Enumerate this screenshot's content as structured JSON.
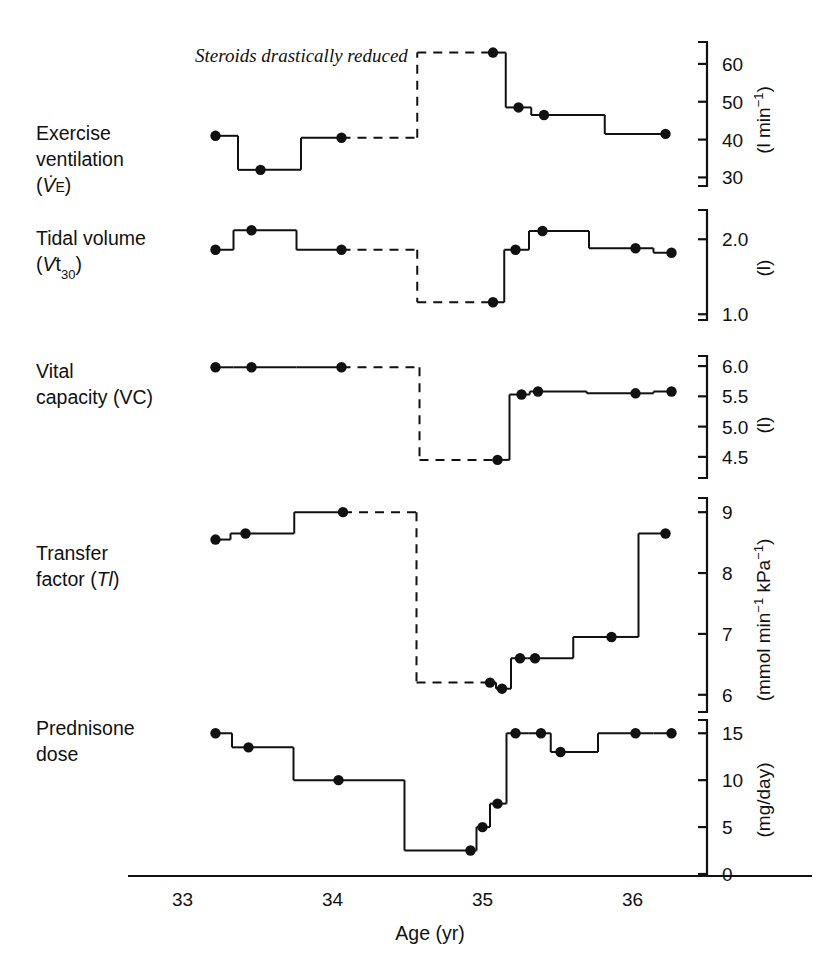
{
  "figure": {
    "background": "#ffffff",
    "ink": "#111111",
    "annotation": "Steroids drastically reduced",
    "xlabel": "Age (yr)",
    "xticks": [
      "33",
      "34",
      "35",
      "36"
    ],
    "xtick_values": [
      33,
      34,
      35,
      36
    ],
    "xlim": [
      32.95,
      36.45
    ]
  },
  "chart_data": {
    "type": "line",
    "title": "",
    "subtitle": "",
    "xlabel": "Age (yr)",
    "ylabel": "",
    "grid": false,
    "legend": "none",
    "annotations": [
      {
        "text": "Steroids drastically reduced",
        "x": 34.93,
        "y_panel": "exercise_ventilation",
        "style": "italic"
      }
    ],
    "x": "Age (yr)",
    "xlim": [
      32.95,
      36.45
    ],
    "xticks": [
      33,
      34,
      35,
      36
    ],
    "step_style": "step-post with vertical connectors; dashed segments indicate interrupted/estimated data",
    "panels": [
      {
        "key": "exercise_ventilation",
        "label_lines": [
          "Exercise",
          "ventilation",
          "(V̇E)"
        ],
        "label_plain": "Exercise ventilation (VE)",
        "unit": "(l min⁻¹)",
        "unit_parts": {
          "pre": "(l min",
          "sup": "−1",
          "post": ")"
        },
        "ylim": [
          28,
          65
        ],
        "yticks": [
          30,
          40,
          50,
          60
        ],
        "ytick_labels": [
          "30",
          "40",
          "50",
          "60"
        ],
        "points": [
          {
            "x": 33.22,
            "y": 41.0,
            "dashed_in": false
          },
          {
            "x": 33.52,
            "y": 32.0,
            "dashed_in": false
          },
          {
            "x": 34.06,
            "y": 40.5,
            "dashed_in": false
          },
          {
            "x": 35.07,
            "y": 63.0,
            "dashed_in": true
          },
          {
            "x": 35.24,
            "y": 48.5,
            "dashed_in": false
          },
          {
            "x": 35.41,
            "y": 46.5,
            "dashed_in": false
          },
          {
            "x": 36.22,
            "y": 41.5,
            "dashed_in": false
          }
        ]
      },
      {
        "key": "tidal_volume",
        "label_lines": [
          "Tidal volume",
          "(Vt30)"
        ],
        "label_plain": "Tidal volume (Vt30)",
        "unit": "(l)",
        "unit_parts": {
          "pre": "(l",
          "sup": "",
          "post": ")"
        },
        "ylim": [
          0.95,
          2.35
        ],
        "yticks": [
          1.0,
          2.0
        ],
        "ytick_labels": [
          "1.0",
          "2.0"
        ],
        "points": [
          {
            "x": 33.22,
            "y": 1.86,
            "dashed_in": false
          },
          {
            "x": 33.46,
            "y": 2.12,
            "dashed_in": false
          },
          {
            "x": 34.06,
            "y": 1.86,
            "dashed_in": false
          },
          {
            "x": 35.07,
            "y": 1.16,
            "dashed_in": true
          },
          {
            "x": 35.22,
            "y": 1.86,
            "dashed_in": false
          },
          {
            "x": 35.4,
            "y": 2.11,
            "dashed_in": false
          },
          {
            "x": 36.02,
            "y": 1.88,
            "dashed_in": false
          },
          {
            "x": 36.26,
            "y": 1.82,
            "dashed_in": false
          }
        ]
      },
      {
        "key": "vital_capacity",
        "label_lines": [
          "Vital",
          "capacity (VC)"
        ],
        "label_plain": "Vital capacity (VC)",
        "unit": "(l)",
        "unit_parts": {
          "pre": "(l",
          "sup": "",
          "post": ")"
        },
        "ylim": [
          4.25,
          6.15
        ],
        "yticks": [
          4.5,
          5.0,
          5.5,
          6.0
        ],
        "ytick_labels": [
          "4.5",
          "5.0",
          "5.5",
          "6.0"
        ],
        "points": [
          {
            "x": 33.22,
            "y": 5.98,
            "dashed_in": false
          },
          {
            "x": 33.46,
            "y": 5.98,
            "dashed_in": false
          },
          {
            "x": 34.06,
            "y": 5.98,
            "dashed_in": false
          },
          {
            "x": 35.1,
            "y": 4.45,
            "dashed_in": true
          },
          {
            "x": 35.26,
            "y": 5.53,
            "dashed_in": false
          },
          {
            "x": 35.37,
            "y": 5.58,
            "dashed_in": false
          },
          {
            "x": 36.02,
            "y": 5.55,
            "dashed_in": false
          },
          {
            "x": 36.26,
            "y": 5.58,
            "dashed_in": false
          }
        ]
      },
      {
        "key": "transfer_factor",
        "label_lines": [
          "Transfer",
          "factor (Tl)"
        ],
        "label_plain": "Transfer factor (Tl)",
        "unit": "(mmol min⁻¹ kPa⁻¹)",
        "unit_parts": {
          "pre": "(mmol min",
          "sup": "−1",
          "mid": " kPa",
          "sup2": "−1",
          "post": ")"
        },
        "ylim": [
          5.75,
          9.2
        ],
        "yticks": [
          6,
          7,
          8,
          9
        ],
        "ytick_labels": [
          "6",
          "7",
          "8",
          "9"
        ],
        "points": [
          {
            "x": 33.22,
            "y": 8.55,
            "dashed_in": false
          },
          {
            "x": 33.42,
            "y": 8.65,
            "dashed_in": false
          },
          {
            "x": 34.07,
            "y": 9.0,
            "dashed_in": false
          },
          {
            "x": 35.05,
            "y": 6.2,
            "dashed_in": true
          },
          {
            "x": 35.13,
            "y": 6.1,
            "dashed_in": false
          },
          {
            "x": 35.25,
            "y": 6.6,
            "dashed_in": false
          },
          {
            "x": 35.35,
            "y": 6.6,
            "dashed_in": false
          },
          {
            "x": 35.86,
            "y": 6.95,
            "dashed_in": false
          },
          {
            "x": 36.22,
            "y": 8.65,
            "dashed_in": false
          }
        ]
      },
      {
        "key": "prednisone_dose",
        "label_lines": [
          "Prednisone",
          "dose"
        ],
        "label_plain": "Prednisone dose",
        "unit": "(mg/day)",
        "unit_parts": {
          "pre": "(mg/day)",
          "sup": "",
          "post": ""
        },
        "ylim": [
          0,
          16.2
        ],
        "yticks": [
          0,
          5,
          10,
          15
        ],
        "ytick_labels": [
          "0",
          "5",
          "10",
          "15"
        ],
        "points": [
          {
            "x": 33.22,
            "y": 15.0,
            "dashed_in": false
          },
          {
            "x": 33.44,
            "y": 13.5,
            "dashed_in": false
          },
          {
            "x": 34.04,
            "y": 10.0,
            "dashed_in": false
          },
          {
            "x": 34.92,
            "y": 2.5,
            "dashed_in": false
          },
          {
            "x": 35.0,
            "y": 5.0,
            "dashed_in": false
          },
          {
            "x": 35.1,
            "y": 7.5,
            "dashed_in": false
          },
          {
            "x": 35.22,
            "y": 15.0,
            "dashed_in": false
          },
          {
            "x": 35.39,
            "y": 15.0,
            "dashed_in": false
          },
          {
            "x": 35.52,
            "y": 13.0,
            "dashed_in": false
          },
          {
            "x": 36.02,
            "y": 15.0,
            "dashed_in": false
          },
          {
            "x": 36.26,
            "y": 15.0,
            "dashed_in": false
          }
        ]
      }
    ]
  }
}
